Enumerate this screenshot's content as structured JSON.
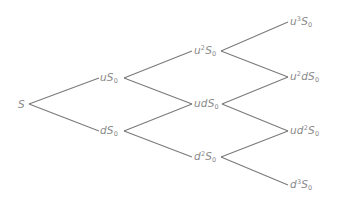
{
  "diagram": {
    "type": "binomial-tree",
    "steps": 3,
    "line_color": "#7a7a7a",
    "text_color": "#8a8a8a",
    "nodes": {
      "root": {
        "base": "S",
        "sup": "",
        "tail": "",
        "sub": ""
      },
      "u": {
        "base": "uS",
        "sup": "",
        "tail": "",
        "sub": "0"
      },
      "d": {
        "base": "dS",
        "sup": "",
        "tail": "",
        "sub": "0"
      },
      "uu": {
        "base": "u",
        "sup": "2",
        "tail": "S",
        "sub": "0"
      },
      "ud": {
        "base": "udS",
        "sup": "",
        "tail": "",
        "sub": "0"
      },
      "dd": {
        "base": "d",
        "sup": "2",
        "tail": "S",
        "sub": "0"
      },
      "uuu": {
        "base": "u",
        "sup": "3",
        "tail": "S",
        "sub": "0"
      },
      "uud": {
        "base": "u",
        "sup": "2",
        "tail": "dS",
        "sub": "0"
      },
      "udd": {
        "base": "ud",
        "sup": "2",
        "tail": "S",
        "sub": "0"
      },
      "ddd": {
        "base": "d",
        "sup": "3",
        "tail": "S",
        "sub": "0"
      }
    },
    "labels_text": [
      "S",
      "uS0",
      "dS0",
      "u2S0",
      "udS0",
      "d2S0",
      "u3S0",
      "u2dS0",
      "ud2S0",
      "d3S0"
    ]
  }
}
